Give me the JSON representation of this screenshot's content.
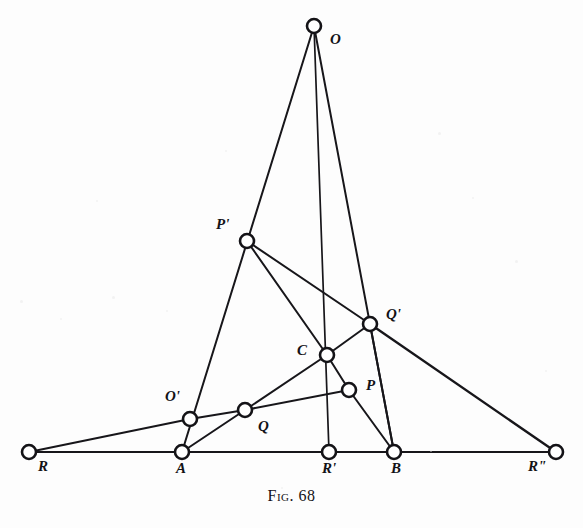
{
  "figure": {
    "caption_prefix": "Fig.",
    "caption_number": "68",
    "caption_full": "Fig. 68",
    "width": 583,
    "height": 528,
    "background_color": "#fdfdfd",
    "ink_color": "#141317",
    "type": "geometric-line-diagram"
  },
  "points": [
    {
      "id": "O",
      "label": "O",
      "x": 314,
      "y": 26,
      "label_x": 330,
      "label_y": 32,
      "label_align": "left"
    },
    {
      "id": "Pp",
      "label": "P'",
      "x": 247,
      "y": 241,
      "label_x": 216,
      "label_y": 217,
      "label_align": "left"
    },
    {
      "id": "Qp",
      "label": "Q'",
      "x": 370,
      "y": 324,
      "label_x": 386,
      "label_y": 307,
      "label_align": "left"
    },
    {
      "id": "C",
      "label": "C",
      "x": 327,
      "y": 355,
      "label_x": 297,
      "label_y": 343,
      "label_align": "left"
    },
    {
      "id": "P",
      "label": "P",
      "x": 349,
      "y": 390,
      "label_x": 366,
      "label_y": 378,
      "label_align": "left"
    },
    {
      "id": "Op",
      "label": "O'",
      "x": 190,
      "y": 419,
      "label_x": 165,
      "label_y": 389,
      "label_align": "left"
    },
    {
      "id": "Q",
      "label": "Q",
      "x": 245,
      "y": 410,
      "label_x": 258,
      "label_y": 419,
      "label_align": "left"
    },
    {
      "id": "R",
      "label": "R",
      "x": 29,
      "y": 452,
      "label_x": 38,
      "label_y": 459,
      "label_align": "left"
    },
    {
      "id": "A",
      "label": "A",
      "x": 182,
      "y": 452,
      "label_x": 176,
      "label_y": 461,
      "label_align": "left"
    },
    {
      "id": "Rp",
      "label": "R'",
      "x": 329,
      "y": 452,
      "label_x": 322,
      "label_y": 461,
      "label_align": "left"
    },
    {
      "id": "B",
      "label": "B",
      "x": 394,
      "y": 452,
      "label_x": 391,
      "label_y": 461,
      "label_align": "left"
    },
    {
      "id": "Rpp",
      "label": "R\"",
      "x": 556,
      "y": 452,
      "label_x": 528,
      "label_y": 459,
      "label_align": "left"
    }
  ],
  "node_radius": 7,
  "edges": [
    {
      "from": "O",
      "to": "A",
      "name": "line-O-Pp-Op-A",
      "width": 2.0,
      "note": "passes through P' and O'"
    },
    {
      "from": "O",
      "to": "Rp",
      "name": "line-O-C-Rp",
      "width": 1.7,
      "note": "passes through C"
    },
    {
      "from": "O",
      "to": "B",
      "name": "line-O-Qp-B",
      "width": 2.0,
      "note": "passes through Q'"
    },
    {
      "from": "Pp",
      "to": "C",
      "name": "line-Pp-C",
      "width": 2.0
    },
    {
      "from": "C",
      "to": "P",
      "name": "line-C-P",
      "width": 2.0
    },
    {
      "from": "P",
      "to": "B",
      "name": "line-P-B",
      "width": 2.0
    },
    {
      "from": "Pp",
      "to": "Qp",
      "name": "line-Pp-Qp",
      "width": 2.0
    },
    {
      "from": "Qp",
      "to": "C",
      "name": "line-Qp-C",
      "width": 2.0
    },
    {
      "from": "C",
      "to": "Q",
      "name": "line-C-Q",
      "width": 2.0
    },
    {
      "from": "Q",
      "to": "A",
      "name": "line-Q-A",
      "width": 2.0
    },
    {
      "from": "Op",
      "to": "Q",
      "name": "line-Op-Q",
      "width": 2.0
    },
    {
      "from": "Q",
      "to": "P",
      "name": "line-Q-P",
      "width": 2.0
    },
    {
      "from": "R",
      "to": "Op",
      "name": "line-R-Op",
      "width": 2.0
    },
    {
      "from": "Qp",
      "to": "Rpp",
      "name": "line-Qp-Rpp",
      "width": 2.4
    },
    {
      "from": "Qp",
      "to": "B",
      "name": "line-Qp-B",
      "width": 2.0
    },
    {
      "from": "R",
      "to": "Rpp",
      "name": "baseline-R-Rpp",
      "width": 2.0,
      "note": "axis through R, A, R', B, R''"
    }
  ],
  "specks": [
    {
      "x": 20,
      "y": 300,
      "d": 3
    },
    {
      "x": 60,
      "y": 318,
      "d": 2
    },
    {
      "x": 112,
      "y": 296,
      "d": 3
    },
    {
      "x": 166,
      "y": 310,
      "d": 2
    },
    {
      "x": 225,
      "y": 150,
      "d": 2
    },
    {
      "x": 438,
      "y": 132,
      "d": 3
    },
    {
      "x": 472,
      "y": 197,
      "d": 2
    },
    {
      "x": 515,
      "y": 260,
      "d": 3
    },
    {
      "x": 96,
      "y": 200,
      "d": 2
    },
    {
      "x": 545,
      "y": 370,
      "d": 2
    },
    {
      "x": 281,
      "y": 487,
      "d": 2
    },
    {
      "x": 430,
      "y": 450,
      "d": 2
    }
  ]
}
